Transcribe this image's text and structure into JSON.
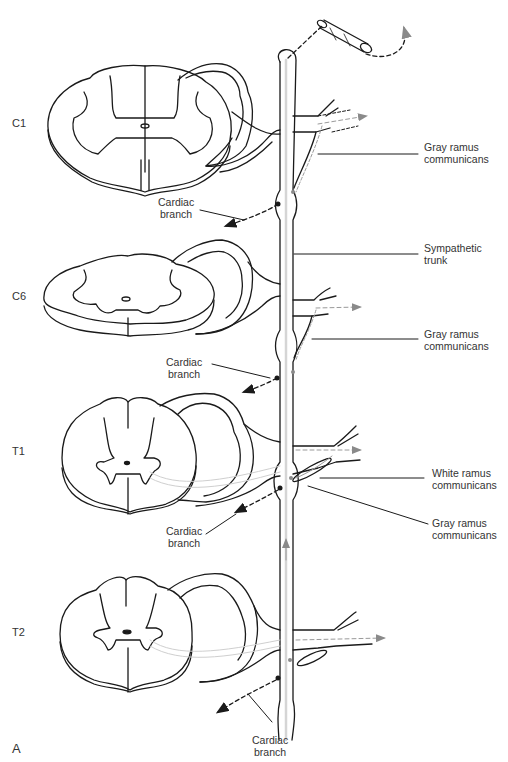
{
  "figure": {
    "panel_label": "A",
    "colors": {
      "line": "#1a1a1a",
      "pathway_gray": "#9a9a9a",
      "pathway_light": "#cfcfcf",
      "background": "#ffffff"
    }
  },
  "levels": [
    {
      "id": "C1",
      "label": "C1"
    },
    {
      "id": "C6",
      "label": "C6"
    },
    {
      "id": "T1",
      "label": "T1"
    },
    {
      "id": "T2",
      "label": "T2"
    }
  ],
  "labels": {
    "gray_ramus_1": {
      "line1": "Gray ramus",
      "line2": "communicans"
    },
    "sympathetic_trunk": {
      "line1": "Sympathetic",
      "line2": "trunk"
    },
    "gray_ramus_2": {
      "line1": "Gray ramus",
      "line2": "communicans"
    },
    "white_ramus": {
      "line1": "White ramus",
      "line2": "communicans"
    },
    "gray_ramus_3": {
      "line1": "Gray ramus",
      "line2": "communicans"
    },
    "cardiac_branch_1": {
      "line1": "Cardiac",
      "line2": "branch"
    },
    "cardiac_branch_2": {
      "line1": "Cardiac",
      "line2": "branch"
    },
    "cardiac_branch_3": {
      "line1": "Cardiac",
      "line2": "branch"
    },
    "cardiac_branch_4": {
      "line1": "Cardiac",
      "line2": "branch"
    }
  }
}
